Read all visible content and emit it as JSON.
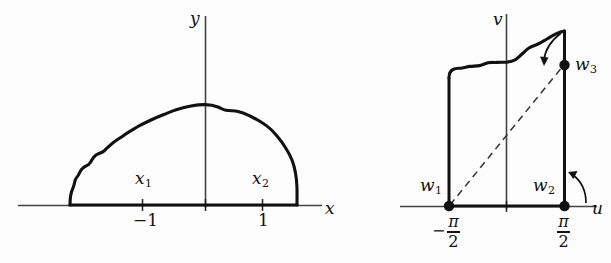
{
  "figure": {
    "background_color": "#fdfdfd",
    "stroke_color": "#111111",
    "axis_color": "#444444"
  },
  "left_panel": {
    "name": "z-plane",
    "x_axis_label": "x",
    "y_axis_label": "y",
    "ticks": [
      {
        "label": "-1",
        "display": "−1"
      },
      {
        "label": "1",
        "display": "1"
      }
    ],
    "point_labels": [
      {
        "base": "x",
        "sub": "1"
      },
      {
        "base": "x",
        "sub": "2"
      }
    ]
  },
  "right_panel": {
    "name": "w-plane",
    "u_axis_label": "u",
    "v_axis_label": "v",
    "vertices": [
      {
        "base": "w",
        "sub": "1"
      },
      {
        "base": "w",
        "sub": "2"
      },
      {
        "base": "w",
        "sub": "3"
      }
    ],
    "tick_labels": [
      {
        "minus": "−",
        "numerator": "π",
        "denominator": "2"
      },
      {
        "minus": "",
        "numerator": "π",
        "denominator": "2"
      }
    ]
  }
}
